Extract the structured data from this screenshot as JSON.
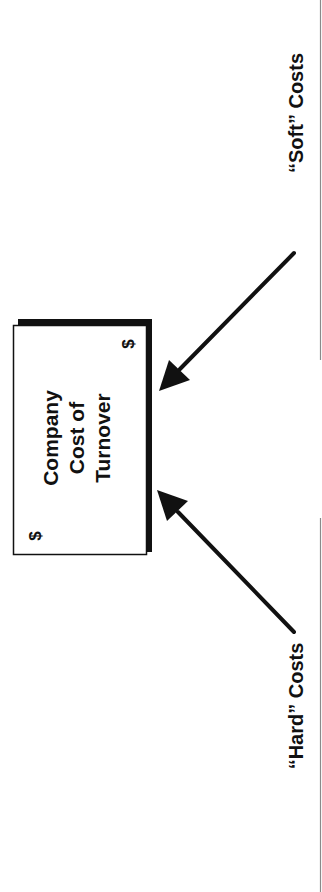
{
  "diagram": {
    "orientation": "rotated 90° counter-clockwise",
    "center_box": {
      "lines": [
        "Company",
        "Cost of",
        "Turnover"
      ],
      "corner_symbol_top": "$",
      "corner_symbol_bottom": "$"
    },
    "inputs": [
      {
        "id": "soft",
        "label": "“Soft” Costs",
        "arrow_target": "center_box"
      },
      {
        "id": "hard",
        "label": "“Hard” Costs",
        "arrow_target": "center_box"
      }
    ],
    "colors": {
      "ink": "#111111",
      "rule": "#8a8a8a",
      "background": "#ffffff"
    }
  }
}
